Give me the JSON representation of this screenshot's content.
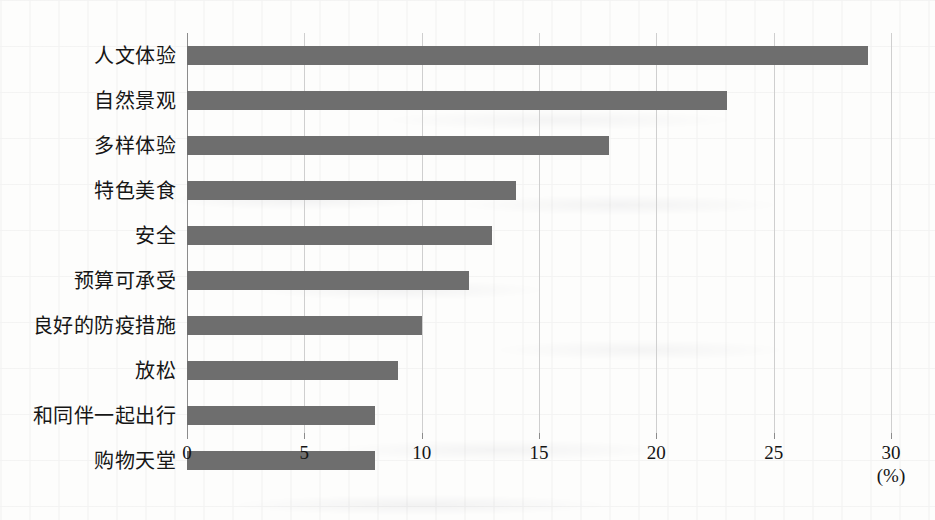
{
  "chart_data": {
    "type": "bar",
    "orientation": "horizontal",
    "title": "",
    "subtitle": "",
    "xlabel": "(%)",
    "ylabel": "",
    "categories": [
      "人文体验",
      "自然景观",
      "多样体验",
      "特色美食",
      "安全",
      "预算可承受",
      "良好的防疫措施",
      "放松",
      "和同伴一起出行",
      "购物天堂"
    ],
    "values": [
      29,
      23,
      18,
      14,
      13,
      12,
      10,
      9,
      8,
      8
    ],
    "xlim": [
      0,
      30
    ],
    "xticks": [
      0,
      5,
      10,
      15,
      20,
      25,
      30
    ],
    "xtick_labels": [
      "0",
      "5",
      "10",
      "15",
      "20",
      "25",
      "30"
    ],
    "unit": "(%)",
    "grid": "vertical",
    "legend": "none",
    "bar_color": "#6e6e6e",
    "gridline_color": "#cfcfcf",
    "axis_color": "#8c8c8c",
    "background_color": "#fdfdfc"
  }
}
